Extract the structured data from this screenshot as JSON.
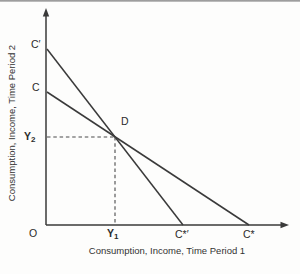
{
  "figure": {
    "type": "intertemporal-budget-constraint-diagram",
    "x_axis_title": "Consumption, Income, Time Period 1",
    "y_axis_title": "Consumption, Income, Time Period 2",
    "labels": {
      "origin": "O",
      "c_prime": "C′",
      "c": "C",
      "y2_main": "Y",
      "y2_sub": "2",
      "y1_main": "Y",
      "y1_sub": "1",
      "d": "D",
      "c_star_prime": "C*′",
      "c_star": "C*"
    },
    "lines": [
      {
        "name": "budget-line-steep",
        "from_label": "C′",
        "to_label": "C*′"
      },
      {
        "name": "budget-line-shallow",
        "from_label": "C",
        "to_label": "C*"
      }
    ],
    "guides": {
      "point": "D",
      "horizontal_to": "Y2 on vertical axis",
      "vertical_to": "Y1 on horizontal axis",
      "style": "dashed"
    },
    "colors": {
      "line": "#3a3a3a",
      "text": "#2b2b2b",
      "background": "#fdfdfc",
      "top_rule": "#8f8f8f"
    }
  }
}
